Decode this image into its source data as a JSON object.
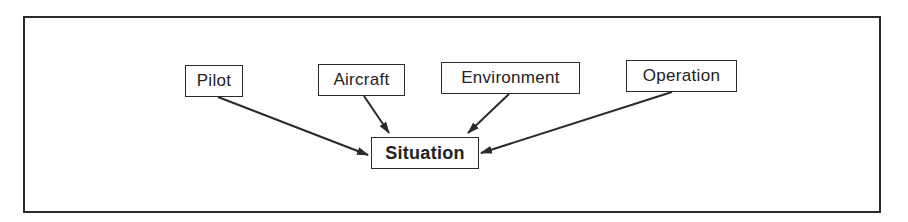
{
  "diagram": {
    "nodes": {
      "pilot": {
        "label": "Pilot"
      },
      "aircraft": {
        "label": "Aircraft"
      },
      "environment": {
        "label": "Environment"
      },
      "operation": {
        "label": "Operation"
      },
      "situation": {
        "label": "Situation"
      }
    },
    "edges": [
      {
        "from": "Pilot",
        "to": "Situation"
      },
      {
        "from": "Aircraft",
        "to": "Situation"
      },
      {
        "from": "Environment",
        "to": "Situation"
      },
      {
        "from": "Operation",
        "to": "Situation"
      }
    ],
    "colors": {
      "stroke": "#2a2a2a",
      "background": "#ffffff",
      "text": "#222222"
    }
  }
}
